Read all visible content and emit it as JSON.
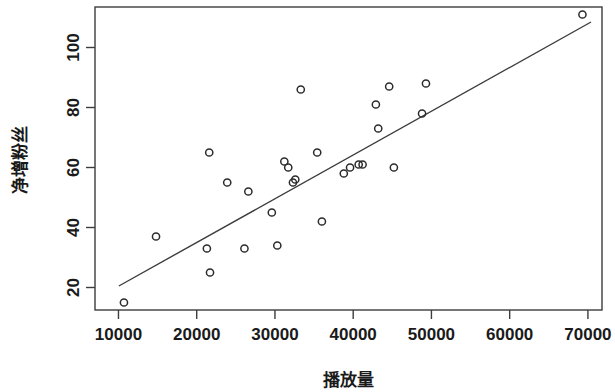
{
  "chart_data": {
    "type": "scatter",
    "title": "",
    "xlabel": "播放量",
    "ylabel": "净增粉丝",
    "xlim": [
      7000,
      71800
    ],
    "ylim": [
      12.5,
      113.5
    ],
    "grid": false,
    "legend": null,
    "xticks": [
      10000,
      20000,
      30000,
      40000,
      50000,
      60000,
      70000
    ],
    "xtick_labels": [
      "10000",
      "20000",
      "30000",
      "40000",
      "50000",
      "60000",
      "70000"
    ],
    "yticks": [
      20,
      40,
      60,
      80,
      100
    ],
    "ytick_labels": [
      "20",
      "40",
      "60",
      "80",
      "100"
    ],
    "marker": "open-circle",
    "point_color": "#2b2b2b",
    "line_color": "#3d3d3d",
    "points": [
      {
        "x": 10700,
        "y": 15
      },
      {
        "x": 14800,
        "y": 37
      },
      {
        "x": 21300,
        "y": 33
      },
      {
        "x": 21600,
        "y": 65
      },
      {
        "x": 21700,
        "y": 25
      },
      {
        "x": 23900,
        "y": 55
      },
      {
        "x": 26100,
        "y": 33
      },
      {
        "x": 26600,
        "y": 52
      },
      {
        "x": 29600,
        "y": 45
      },
      {
        "x": 30300,
        "y": 34
      },
      {
        "x": 31200,
        "y": 62
      },
      {
        "x": 31700,
        "y": 60
      },
      {
        "x": 32300,
        "y": 55
      },
      {
        "x": 32600,
        "y": 56
      },
      {
        "x": 33300,
        "y": 86
      },
      {
        "x": 35400,
        "y": 65
      },
      {
        "x": 36000,
        "y": 42
      },
      {
        "x": 38800,
        "y": 58
      },
      {
        "x": 39600,
        "y": 60
      },
      {
        "x": 40700,
        "y": 61
      },
      {
        "x": 41200,
        "y": 61
      },
      {
        "x": 42900,
        "y": 81
      },
      {
        "x": 43200,
        "y": 73
      },
      {
        "x": 44600,
        "y": 87
      },
      {
        "x": 45200,
        "y": 60
      },
      {
        "x": 48800,
        "y": 78
      },
      {
        "x": 49300,
        "y": 88
      },
      {
        "x": 69300,
        "y": 111
      }
    ],
    "fit_line": {
      "label": "regression line",
      "x_start": 10050,
      "y_start": 20.5,
      "x_end": 70400,
      "y_end": 108.5
    }
  },
  "figure": {
    "background": "#ffffff",
    "axis_color": "#3d3d3d",
    "text_color": "#1a1a1a"
  }
}
